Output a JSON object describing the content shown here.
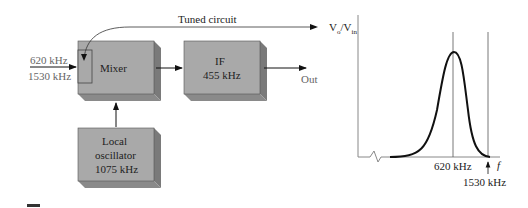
{
  "block_diagram": {
    "input_freqs": [
      "620 kHz",
      "1530 kHz"
    ],
    "tuned_label": "Tuned circuit",
    "mixer_label": "Mixer",
    "if_label_1": "IF",
    "if_label_2": "455 kHz",
    "out_label": "Out",
    "lo_label_1": "Local",
    "lo_label_2": "oscillator",
    "lo_label_3": "1075 kHz",
    "block_color": "#a9a9a9",
    "shadow_color": "#7a7a7a"
  },
  "response_plot": {
    "y_label": "V",
    "y_sub_o": "o",
    "y_sub_in": "in",
    "marker_620": "620 kHz",
    "marker_1530": "1530 kHz",
    "x_label": "f"
  }
}
